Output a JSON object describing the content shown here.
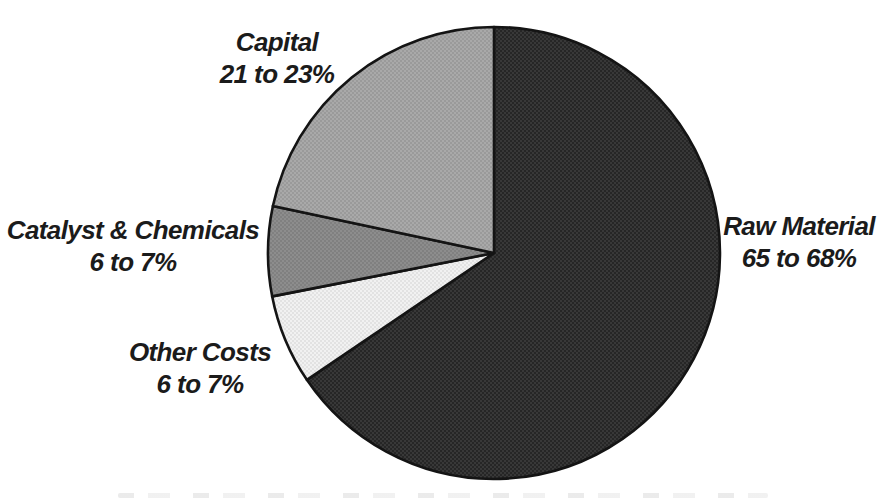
{
  "chart_data": {
    "type": "pie",
    "title": "",
    "direction": "clockwise",
    "start_angle_deg": 0,
    "labels_position": "outside",
    "legend": "none",
    "background_color": "#ffffff",
    "outline_color": "#141414",
    "segments": [
      {
        "label": "Raw Material",
        "range_label": "65 to 68%",
        "value": 66.5,
        "color": "#262626",
        "texture_dot": "#383838"
      },
      {
        "label": "Other Costs",
        "range_label": "6 to 7%",
        "value": 6.5,
        "color": "#f1f1f1",
        "texture_dot": "#e2e2e2"
      },
      {
        "label": "Catalyst & Chemicals",
        "range_label": "6 to 7%",
        "value": 6.5,
        "color": "#8d8d8d",
        "texture_dot": "#808080"
      },
      {
        "label": "Capital",
        "range_label": "21 to 23%",
        "value": 22.0,
        "color": "#a9a9a9",
        "texture_dot": "#9a9a9a"
      }
    ],
    "geometry_note": "scanned figure, slices drawn clockwise from 12 o'clock in listed order"
  }
}
